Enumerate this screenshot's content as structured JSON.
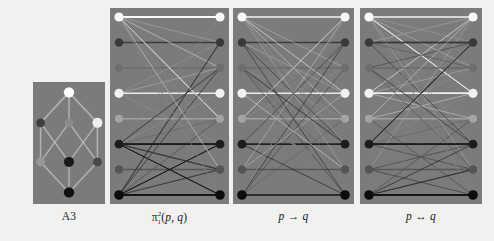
{
  "figure": {
    "background_color": "#f4f4f2",
    "panel_background_color": "#7d7d7d",
    "panel_count": 4
  },
  "panels": [
    {
      "id": "lattice-a3",
      "caption": "A3",
      "caption_kind": "plain",
      "type": "hasse-lattice",
      "x": 33,
      "y": 82,
      "width": 72,
      "height": 122,
      "nodes": [
        {
          "id": "top",
          "cx": 0.5,
          "cy": 0.085,
          "color": "#ffffff",
          "r": 5.2
        },
        {
          "id": "uleft",
          "cx": 0.105,
          "cy": 0.335,
          "color": "#3f3f3f",
          "r": 4.4
        },
        {
          "id": "umid",
          "cx": 0.5,
          "cy": 0.335,
          "color": "#8e8e8e",
          "r": 4.4
        },
        {
          "id": "uright",
          "cx": 0.895,
          "cy": 0.335,
          "color": "#f2f2f2",
          "r": 5.0
        },
        {
          "id": "lleft",
          "cx": 0.105,
          "cy": 0.655,
          "color": "#9a9a9a",
          "r": 4.4
        },
        {
          "id": "lmid",
          "cx": 0.5,
          "cy": 0.655,
          "color": "#1a1a1a",
          "r": 5.0
        },
        {
          "id": "lright",
          "cx": 0.895,
          "cy": 0.655,
          "color": "#4a4a4a",
          "r": 4.4
        },
        {
          "id": "bottom",
          "cx": 0.5,
          "cy": 0.905,
          "color": "#111111",
          "r": 5.2
        }
      ],
      "edges": [
        [
          "top",
          "uleft"
        ],
        [
          "top",
          "umid"
        ],
        [
          "top",
          "uright"
        ],
        [
          "uleft",
          "lleft"
        ],
        [
          "uleft",
          "lmid"
        ],
        [
          "umid",
          "lleft"
        ],
        [
          "umid",
          "lright"
        ],
        [
          "uright",
          "lmid"
        ],
        [
          "uright",
          "lright"
        ],
        [
          "lleft",
          "bottom"
        ],
        [
          "lmid",
          "bottom"
        ],
        [
          "lright",
          "bottom"
        ]
      ],
      "edge_color": "#bdbdbd"
    },
    {
      "id": "pi-1-2",
      "caption": "π₁²(p, q)",
      "caption_kind": "math-pi",
      "type": "bipartite",
      "x": 110,
      "y": 8,
      "width": 119,
      "height": 196,
      "density": "sparse-fan",
      "edge_count": 58,
      "left_nodes": [
        {
          "i": 0,
          "color": "#fdfdfd",
          "r": 4.6
        },
        {
          "i": 1,
          "color": "#3a3a3a",
          "r": 4.2
        },
        {
          "i": 2,
          "color": "#6f6f6f",
          "r": 4.0
        },
        {
          "i": 3,
          "color": "#f4f4f4",
          "r": 4.6
        },
        {
          "i": 4,
          "color": "#a6a6a6",
          "r": 4.0
        },
        {
          "i": 5,
          "color": "#1d1d1d",
          "r": 4.4
        },
        {
          "i": 6,
          "color": "#555555",
          "r": 4.2
        },
        {
          "i": 7,
          "color": "#0d0d0d",
          "r": 4.8
        }
      ],
      "right_nodes": [
        {
          "i": 0,
          "color": "#fdfdfd",
          "r": 4.6
        },
        {
          "i": 1,
          "color": "#3a3a3a",
          "r": 4.2
        },
        {
          "i": 2,
          "color": "#6f6f6f",
          "r": 4.0
        },
        {
          "i": 3,
          "color": "#f4f4f4",
          "r": 4.6
        },
        {
          "i": 4,
          "color": "#a6a6a6",
          "r": 4.0
        },
        {
          "i": 5,
          "color": "#1d1d1d",
          "r": 4.4
        },
        {
          "i": 6,
          "color": "#555555",
          "r": 4.2
        },
        {
          "i": 7,
          "color": "#0d0d0d",
          "r": 4.8
        }
      ]
    },
    {
      "id": "implication",
      "caption": "p → q",
      "caption_kind": "math-arrow",
      "type": "bipartite",
      "x": 233,
      "y": 8,
      "width": 121,
      "height": 196,
      "density": "medium-cross",
      "edge_count": 54,
      "left_nodes": [
        {
          "i": 0,
          "color": "#fdfdfd",
          "r": 4.6
        },
        {
          "i": 1,
          "color": "#3a3a3a",
          "r": 4.2
        },
        {
          "i": 2,
          "color": "#6f6f6f",
          "r": 4.0
        },
        {
          "i": 3,
          "color": "#f4f4f4",
          "r": 4.6
        },
        {
          "i": 4,
          "color": "#a6a6a6",
          "r": 4.0
        },
        {
          "i": 5,
          "color": "#1d1d1d",
          "r": 4.4
        },
        {
          "i": 6,
          "color": "#555555",
          "r": 4.2
        },
        {
          "i": 7,
          "color": "#0d0d0d",
          "r": 4.8
        }
      ],
      "right_nodes": [
        {
          "i": 0,
          "color": "#fdfdfd",
          "r": 4.6
        },
        {
          "i": 1,
          "color": "#3a3a3a",
          "r": 4.2
        },
        {
          "i": 2,
          "color": "#6f6f6f",
          "r": 4.0
        },
        {
          "i": 3,
          "color": "#f4f4f4",
          "r": 4.6
        },
        {
          "i": 4,
          "color": "#a6a6a6",
          "r": 4.0
        },
        {
          "i": 5,
          "color": "#1d1d1d",
          "r": 4.4
        },
        {
          "i": 6,
          "color": "#555555",
          "r": 4.2
        },
        {
          "i": 7,
          "color": "#0d0d0d",
          "r": 4.8
        }
      ]
    },
    {
      "id": "equivalence",
      "caption": "p ↔ q",
      "caption_kind": "math-arrow",
      "type": "bipartite",
      "x": 360,
      "y": 8,
      "width": 122,
      "height": 196,
      "density": "dense-hub",
      "edge_count": 62,
      "left_nodes": [
        {
          "i": 0,
          "color": "#fdfdfd",
          "r": 4.6
        },
        {
          "i": 1,
          "color": "#3a3a3a",
          "r": 4.2
        },
        {
          "i": 2,
          "color": "#6f6f6f",
          "r": 4.0
        },
        {
          "i": 3,
          "color": "#f4f4f4",
          "r": 4.6
        },
        {
          "i": 4,
          "color": "#a6a6a6",
          "r": 4.0
        },
        {
          "i": 5,
          "color": "#1d1d1d",
          "r": 4.4
        },
        {
          "i": 6,
          "color": "#555555",
          "r": 4.2
        },
        {
          "i": 7,
          "color": "#0d0d0d",
          "r": 4.8
        }
      ],
      "right_nodes": [
        {
          "i": 0,
          "color": "#fdfdfd",
          "r": 4.6
        },
        {
          "i": 1,
          "color": "#3a3a3a",
          "r": 4.2
        },
        {
          "i": 2,
          "color": "#6f6f6f",
          "r": 4.0
        },
        {
          "i": 3,
          "color": "#f4f4f4",
          "r": 4.6
        },
        {
          "i": 4,
          "color": "#a6a6a6",
          "r": 4.0
        },
        {
          "i": 5,
          "color": "#1d1d1d",
          "r": 4.4
        },
        {
          "i": 6,
          "color": "#555555",
          "r": 4.2
        },
        {
          "i": 7,
          "color": "#0d0d0d",
          "r": 4.8
        }
      ]
    }
  ],
  "captions": {
    "a3": "A3",
    "pi_base": "π",
    "pi_sup": "2",
    "pi_sub": "1",
    "pi_args_open": "(",
    "pi_p": "p",
    "pi_comma": ", ",
    "pi_q": "q",
    "pi_args_close": ")",
    "impl_p": "p",
    "impl_arrow": "→",
    "impl_q": "q",
    "equiv_p": "p",
    "equiv_arrow": "↔",
    "equiv_q": "q"
  }
}
